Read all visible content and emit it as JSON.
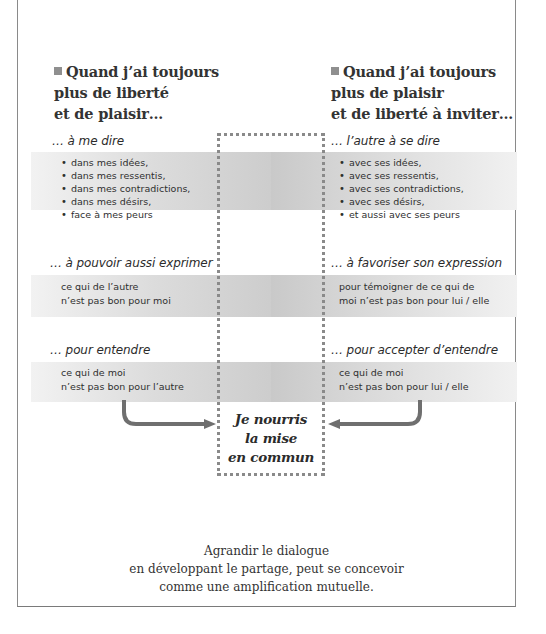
{
  "left_column": {
    "heading": [
      "Quand j’ai toujours",
      "plus de liberté",
      "et de plaisir…"
    ],
    "sections": [
      {
        "title": "… à me dire",
        "items": [
          "dans mes idées,",
          "dans mes ressentis,",
          "dans mes contradictions,",
          "dans mes désirs,",
          "face à mes peurs"
        ]
      },
      {
        "title": "… à pouvoir aussi exprimer",
        "text": "ce qui de l’autre\nn’est pas bon pour moi"
      },
      {
        "title": "… pour entendre",
        "text": "ce qui de moi\nn’est pas bon pour l’autre"
      }
    ]
  },
  "right_column": {
    "heading": [
      "Quand j’ai toujours",
      "plus de plaisir",
      "et de liberté à inviter…"
    ],
    "sections": [
      {
        "title": "… l’autre à se dire",
        "items": [
          "avec ses idées,",
          "avec ses ressentis,",
          "avec ses contradictions,",
          "avec ses désirs,",
          "et aussi avec ses peurs"
        ]
      },
      {
        "title": "… à favoriser son expression",
        "text": "pour témoigner de ce qui de\nmoi n’est pas bon pour lui / elle"
      },
      {
        "title": "… pour accepter d’entendre",
        "text": "ce qui de moi\nn’est pas bon pour lui / elle"
      }
    ]
  },
  "center": {
    "lines": [
      "Je nourris",
      "la mise",
      "en commun"
    ]
  },
  "caption": "Agrandir le dialogue\nen développant le partage, peut se concevoir\ncomme une amplification mutuelle.",
  "colors": {
    "band_dark": "#c9c9c9",
    "band_light": "#f2f2f2",
    "arrow": "#6f6f6f",
    "dots": "#8a8a8a",
    "bullet_square": "#8f8f8f"
  }
}
